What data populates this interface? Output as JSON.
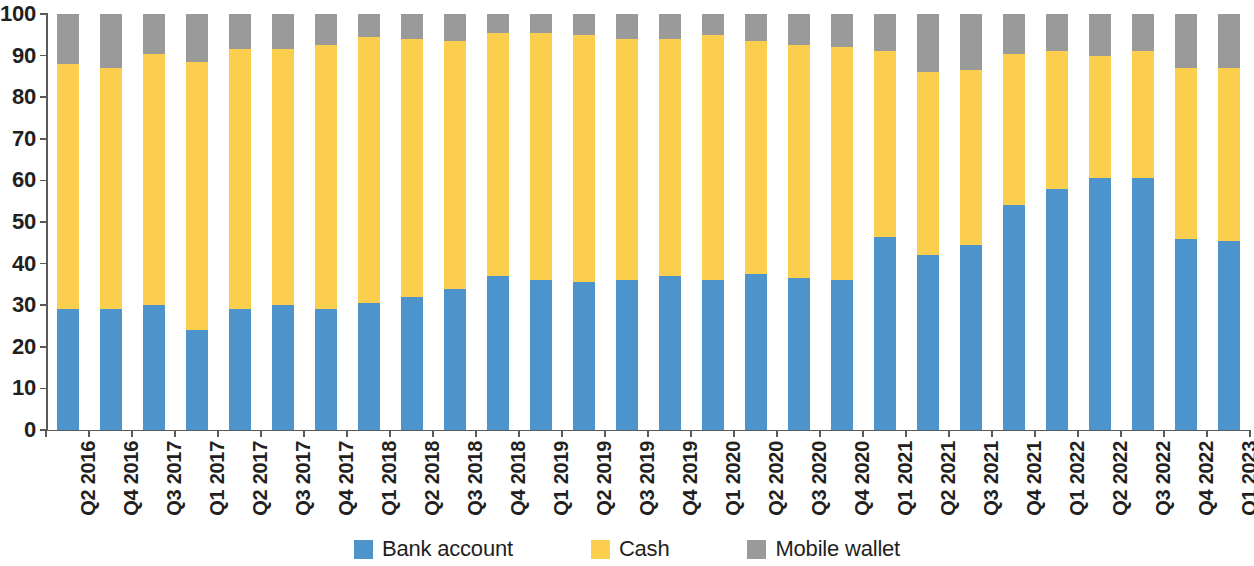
{
  "chart_data": {
    "type": "bar",
    "stacked": true,
    "stack_mode": "percent",
    "title": "",
    "subtitle": "",
    "xlabel": "",
    "ylabel": "",
    "ylim": [
      0,
      100
    ],
    "ytick_labels": [
      "100",
      "90",
      "80",
      "70",
      "60",
      "50",
      "40",
      "30",
      "20",
      "10",
      "0"
    ],
    "ytick_values": [
      100,
      90,
      80,
      70,
      60,
      50,
      40,
      30,
      20,
      10,
      0
    ],
    "grid": false,
    "legend_position": "bottom",
    "categories": [
      "Q2 2016",
      "Q4 2016",
      "Q3 2017",
      "Q1 2017",
      "Q2 2017",
      "Q3 2017",
      "Q4 2017",
      "Q1 2018",
      "Q2 2018",
      "Q3 2018",
      "Q4 2018",
      "Q1 2019",
      "Q2 2019",
      "Q3 2019",
      "Q4 2019",
      "Q1 2020",
      "Q2 2020",
      "Q3 2020",
      "Q4 2020",
      "Q1 2021",
      "Q2 2021",
      "Q3 2021",
      "Q4 2021",
      "Q1 2022",
      "Q2 2022",
      "Q3 2022",
      "Q4 2022",
      "Q1 2023"
    ],
    "series": [
      {
        "name": "Bank account",
        "color": "#4d94cc",
        "values": [
          29,
          29,
          30,
          24,
          29,
          30,
          29,
          30.5,
          32,
          34,
          37,
          36,
          35.5,
          36,
          37,
          36,
          37.5,
          36.5,
          36,
          46.5,
          42,
          44.5,
          54,
          58,
          60.5,
          60.5,
          46,
          45.5
        ]
      },
      {
        "name": "Cash",
        "color": "#fbcf4d",
        "values": [
          59,
          58,
          60.5,
          64.5,
          62.5,
          61.5,
          63.5,
          64,
          62,
          59.5,
          58.5,
          59.5,
          59.5,
          58,
          57,
          59,
          56,
          56,
          56,
          44.5,
          44,
          42,
          36.5,
          33,
          29.5,
          30.5,
          41,
          41.5
        ]
      },
      {
        "name": "Mobile wallet",
        "color": "#9a9a9a",
        "values": [
          12,
          13,
          9.5,
          11.5,
          8.5,
          8.5,
          7.5,
          5.5,
          6,
          6.5,
          4.5,
          4.5,
          5,
          6,
          6,
          5,
          6.5,
          7.5,
          8,
          9,
          14,
          13.5,
          9.5,
          9,
          10,
          9,
          13,
          13
        ]
      }
    ]
  },
  "legend": {
    "items": [
      {
        "label": "Bank account",
        "color": "#4d94cc",
        "swatch": "bank-account-swatch"
      },
      {
        "label": "Cash",
        "color": "#fbcf4d",
        "swatch": "cash-swatch"
      },
      {
        "label": "Mobile wallet",
        "color": "#9a9a9a",
        "swatch": "mobile-wallet-swatch"
      }
    ]
  }
}
